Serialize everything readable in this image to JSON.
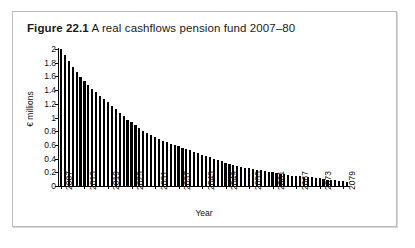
{
  "figure": {
    "number": "Figure 22.1",
    "caption": "A real cashflows pension fund 2007–80"
  },
  "chart_data": {
    "type": "bar",
    "title": "A real cashflows pension fund 2007–80",
    "xlabel": "Year",
    "ylabel": "€ millions",
    "ylim": [
      0,
      2
    ],
    "ytick_labels": [
      "0",
      "0.2",
      "0.4",
      "0.6",
      "0.8",
      "1",
      "1.2",
      "1.4",
      "1.6",
      "1.8",
      "2"
    ],
    "ytick_values": [
      0,
      0.2,
      0.4,
      0.6,
      0.8,
      1,
      1.2,
      1.4,
      1.6,
      1.8,
      2
    ],
    "xtick_labels": [
      "2007",
      "2013",
      "2019",
      "2025",
      "2031",
      "2037",
      "2043",
      "2049",
      "2055",
      "2061",
      "2067",
      "2073",
      "2079"
    ],
    "xtick_interval": 6,
    "grid": false,
    "legend": null,
    "bar_color": "#000000",
    "categories": [
      "2007",
      "2008",
      "2009",
      "2010",
      "2011",
      "2012",
      "2013",
      "2014",
      "2015",
      "2016",
      "2017",
      "2018",
      "2019",
      "2020",
      "2021",
      "2022",
      "2023",
      "2024",
      "2025",
      "2026",
      "2027",
      "2028",
      "2029",
      "2030",
      "2031",
      "2032",
      "2033",
      "2034",
      "2035",
      "2036",
      "2037",
      "2038",
      "2039",
      "2040",
      "2041",
      "2042",
      "2043",
      "2044",
      "2045",
      "2046",
      "2047",
      "2048",
      "2049",
      "2050",
      "2051",
      "2052",
      "2053",
      "2054",
      "2055",
      "2056",
      "2057",
      "2058",
      "2059",
      "2060",
      "2061",
      "2062",
      "2063",
      "2064",
      "2065",
      "2066",
      "2067",
      "2068",
      "2069",
      "2070",
      "2071",
      "2072",
      "2073",
      "2074",
      "2075",
      "2076",
      "2077",
      "2078",
      "2079",
      "2080"
    ],
    "values": [
      2.0,
      1.91,
      1.82,
      1.74,
      1.66,
      1.59,
      1.53,
      1.47,
      1.42,
      1.37,
      1.32,
      1.27,
      1.22,
      1.17,
      1.12,
      1.07,
      1.02,
      0.97,
      0.93,
      0.89,
      0.85,
      0.81,
      0.77,
      0.74,
      0.71,
      0.68,
      0.66,
      0.64,
      0.62,
      0.6,
      0.58,
      0.56,
      0.54,
      0.52,
      0.5,
      0.48,
      0.46,
      0.44,
      0.42,
      0.4,
      0.38,
      0.36,
      0.34,
      0.32,
      0.3,
      0.29,
      0.28,
      0.27,
      0.26,
      0.25,
      0.24,
      0.23,
      0.22,
      0.21,
      0.2,
      0.19,
      0.18,
      0.17,
      0.16,
      0.15,
      0.145,
      0.14,
      0.135,
      0.13,
      0.125,
      0.12,
      0.11,
      0.1,
      0.095,
      0.09,
      0.085,
      0.08,
      0.075,
      0.06
    ]
  }
}
